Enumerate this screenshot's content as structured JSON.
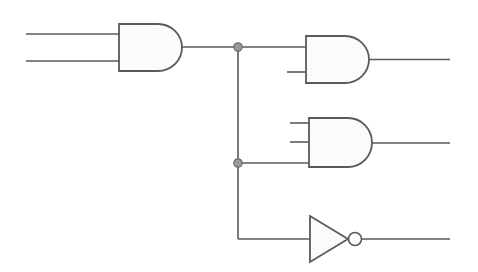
{
  "diagram": {
    "type": "logic-circuit",
    "colors": {
      "stroke": "#5a5a5a",
      "gate_fill": "#fbfbfb",
      "junction_fill": "#9a9a9a",
      "background": "#ffffff"
    },
    "gates": [
      {
        "id": "and1",
        "kind": "AND",
        "inputs": 2
      },
      {
        "id": "and2",
        "kind": "AND",
        "inputs": 2
      },
      {
        "id": "and3",
        "kind": "AND",
        "inputs": 3
      },
      {
        "id": "not1",
        "kind": "NOT",
        "inputs": 1
      }
    ],
    "junctions": [
      {
        "id": "j1",
        "connects": [
          "and1.out",
          "and2.in1",
          "bus"
        ]
      },
      {
        "id": "j2",
        "connects": [
          "bus",
          "and3.in3"
        ]
      }
    ],
    "connections": [
      "input_a -> and1.in1",
      "input_b -> and1.in2",
      "and1.out -> j1",
      "j1 -> and2.in1",
      "j1 -> j2",
      "j2 -> and3.in3",
      "j2 -> not1.in",
      "and2.out -> output_1",
      "and3.out -> output_2",
      "not1.out -> output_3"
    ]
  }
}
